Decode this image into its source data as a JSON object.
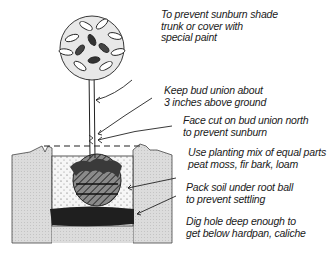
{
  "diagram": {
    "colors": {
      "ink": "#1a1a1a",
      "soil": "#d9d9d9",
      "planting_mix": "#f4f4f4",
      "hardpan": "#222222",
      "root_ball": "#555555"
    },
    "annotations": [
      {
        "id": "sunburn-shade",
        "lines": [
          "To prevent sunburn shade",
          "trunk or cover with",
          "special paint"
        ]
      },
      {
        "id": "bud-union-height",
        "lines": [
          "Keep bud union about",
          "3 inches above ground"
        ]
      },
      {
        "id": "bud-union-north",
        "lines": [
          "Face cut on bud union north",
          "to prevent sunburn"
        ]
      },
      {
        "id": "planting-mix",
        "lines": [
          "Use planting mix of equal parts",
          "peat moss, fir bark, loam"
        ]
      },
      {
        "id": "pack-soil",
        "lines": [
          "Pack soil under root ball",
          "to prevent settling"
        ]
      },
      {
        "id": "dig-hole",
        "lines": [
          "Dig hole deep enough to",
          "get below hardpan, caliche"
        ]
      }
    ]
  }
}
